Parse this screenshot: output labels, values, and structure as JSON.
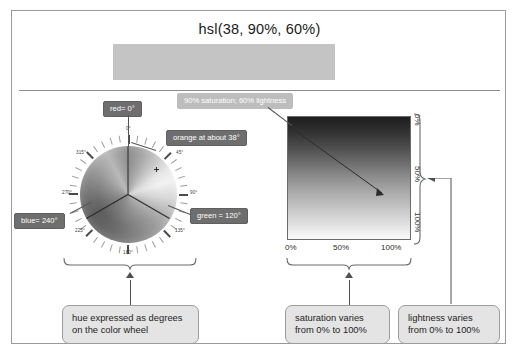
{
  "figure": {
    "title": "hsl(38, 90%, 60%)",
    "swatch_color": "#c4c4c4"
  },
  "wheel": {
    "tick_labels": [
      {
        "text": "0°",
        "deg": 0
      },
      {
        "text": "45°",
        "deg": 45
      },
      {
        "text": "90°",
        "deg": 90
      },
      {
        "text": "135°",
        "deg": 135
      },
      {
        "text": "180°",
        "deg": 180
      },
      {
        "text": "225°",
        "deg": 225
      },
      {
        "text": "270°",
        "deg": 270
      },
      {
        "text": "315°",
        "deg": 315
      }
    ],
    "callouts": {
      "red": "red= 0°",
      "green": "green = 120°",
      "blue": "blue= 240°",
      "orange": "orange at about 38°"
    }
  },
  "gradient": {
    "callout": "90% saturation; 60% lightness",
    "x_labels": [
      "0%",
      "50%",
      "100%"
    ],
    "y_labels": [
      "0%",
      "50%",
      "100%"
    ]
  },
  "annotations": {
    "hue": "hue expressed as degrees on the color wheel",
    "hue_line1": "hue expressed as degrees",
    "hue_line2": "on the color wheel",
    "saturation_line1": "saturation varies",
    "saturation_line2": "from 0% to 100%",
    "lightness_line1": "lightness varies",
    "lightness_line2": "from 0% to 100%"
  },
  "chart_data": {
    "type": "heatmap",
    "title": "hsl(38, 90%, 60%)",
    "xlabel": "saturation",
    "ylabel": "lightness",
    "xlim": [
      0,
      100
    ],
    "ylim": [
      0,
      100
    ],
    "x_ticks": [
      "0%",
      "50%",
      "100%"
    ],
    "y_ticks": [
      "0%",
      "50%",
      "100%"
    ],
    "selected_point": {
      "saturation": 90,
      "lightness": 60
    },
    "hue_wheel": {
      "type": "pie",
      "categories": [
        "0°",
        "45°",
        "90°",
        "135°",
        "180°",
        "225°",
        "270°",
        "315°"
      ],
      "values": [
        45,
        45,
        45,
        45,
        45,
        45,
        45,
        45
      ],
      "marker_hue": 38,
      "named_hues": [
        {
          "name": "red",
          "deg": 0
        },
        {
          "name": "green",
          "deg": 120
        },
        {
          "name": "blue",
          "deg": 240
        }
      ]
    }
  }
}
